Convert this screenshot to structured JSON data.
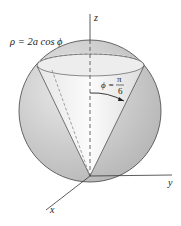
{
  "figure": {
    "type": "3d-surface-diagram",
    "labels": {
      "sphere_equation": "ρ = 2a cos ϕ",
      "cone_phi": "ϕ =",
      "cone_num": "π",
      "cone_den": "6",
      "z_axis": "z",
      "y_axis": "y",
      "x_axis": "x"
    },
    "colors": {
      "sphere_fill": "#c9c9c9",
      "cone_interior": "#f3f3f3",
      "outline": "#333333",
      "dashed": "#555555"
    }
  }
}
